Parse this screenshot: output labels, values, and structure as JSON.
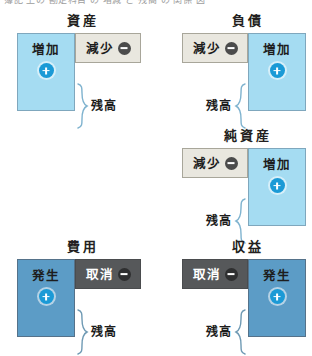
{
  "page": {
    "top_clipped_text": "簿記 上の 勘定科目 の 増減 と 残高 の 関係 図",
    "background_color": "#ffffff"
  },
  "colors": {
    "light_blue_fill": "#a5dcf2",
    "beige_fill": "#e9e7df",
    "steel_blue_fill": "#5c9cc6",
    "dark_gray_fill": "#56585a",
    "plus_badge": "#1b9ad6",
    "minus_badge": "#4b4b4b",
    "text": "#1d1d1d"
  },
  "labels": {
    "increase": "増加",
    "decrease": "減少",
    "occurrence": "発生",
    "cancellation": "取消",
    "balance": "残高",
    "plus_sign": "+",
    "minus_sign": "−"
  },
  "diagrams": [
    {
      "id": "assets",
      "title": "資産",
      "balance_side": "left",
      "palette": "light",
      "left_cell": {
        "label": "増加",
        "sign": "plus"
      },
      "right_cell": {
        "label": "減少",
        "sign": "minus"
      },
      "balance_label": "残高"
    },
    {
      "id": "liabilities",
      "title": "負債",
      "balance_side": "right",
      "palette": "light",
      "left_cell": {
        "label": "減少",
        "sign": "minus"
      },
      "right_cell": {
        "label": "増加",
        "sign": "plus"
      },
      "balance_label": "残高"
    },
    {
      "id": "net-assets",
      "title": "純資産",
      "balance_side": "right",
      "palette": "light",
      "left_cell": {
        "label": "減少",
        "sign": "minus"
      },
      "right_cell": {
        "label": "増加",
        "sign": "plus"
      },
      "balance_label": "残高"
    },
    {
      "id": "expenses",
      "title": "費用",
      "balance_side": "left",
      "palette": "dark",
      "left_cell": {
        "label": "発生",
        "sign": "plus"
      },
      "right_cell": {
        "label": "取消",
        "sign": "minus"
      },
      "balance_label": "残高"
    },
    {
      "id": "revenue",
      "title": "収益",
      "balance_side": "right",
      "palette": "dark",
      "left_cell": {
        "label": "取消",
        "sign": "minus"
      },
      "right_cell": {
        "label": "発生",
        "sign": "plus"
      },
      "balance_label": "残高"
    }
  ]
}
